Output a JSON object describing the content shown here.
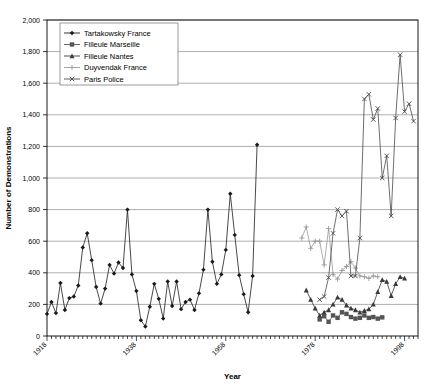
{
  "chart_data": {
    "type": "line",
    "title": "",
    "xlabel": "Year",
    "ylabel": "Number of Demonstrations",
    "xlim": [
      1918,
      2001
    ],
    "ylim": [
      0,
      2000
    ],
    "ytick_step": 200,
    "ytick_labels": [
      "0",
      "200",
      "400",
      "600",
      "800",
      "1,000",
      "1,200",
      "1,400",
      "1,600",
      "1,800",
      "2,000"
    ],
    "xtick_labels": [
      "1918",
      "1938",
      "1958",
      "1978",
      "1998"
    ],
    "xtick_values": [
      1918,
      1938,
      1958,
      1978,
      1998
    ],
    "xtick_minor_step": 1,
    "grid": "horizontal",
    "legend_position": "top-left",
    "series": [
      {
        "name": "Tartakowsky France",
        "marker": "diamond",
        "color": "#1a1a1a",
        "points": [
          [
            1918,
            140
          ],
          [
            1919,
            215
          ],
          [
            1920,
            145
          ],
          [
            1921,
            335
          ],
          [
            1922,
            165
          ],
          [
            1923,
            240
          ],
          [
            1924,
            250
          ],
          [
            1925,
            320
          ],
          [
            1926,
            560
          ],
          [
            1927,
            650
          ],
          [
            1928,
            480
          ],
          [
            1929,
            310
          ],
          [
            1930,
            205
          ],
          [
            1931,
            300
          ],
          [
            1932,
            450
          ],
          [
            1933,
            395
          ],
          [
            1934,
            465
          ],
          [
            1935,
            430
          ],
          [
            1936,
            800
          ],
          [
            1937,
            390
          ],
          [
            1938,
            285
          ],
          [
            1939,
            100
          ],
          [
            1940,
            60
          ],
          [
            1941,
            185
          ],
          [
            1942,
            330
          ],
          [
            1943,
            235
          ],
          [
            1944,
            110
          ],
          [
            1945,
            345
          ],
          [
            1946,
            190
          ],
          [
            1947,
            345
          ],
          [
            1948,
            170
          ],
          [
            1949,
            215
          ],
          [
            1950,
            230
          ],
          [
            1951,
            165
          ],
          [
            1952,
            270
          ],
          [
            1953,
            420
          ],
          [
            1954,
            800
          ],
          [
            1955,
            470
          ],
          [
            1956,
            330
          ],
          [
            1957,
            390
          ],
          [
            1958,
            545
          ],
          [
            1959,
            900
          ],
          [
            1960,
            640
          ],
          [
            1961,
            385
          ],
          [
            1962,
            265
          ],
          [
            1963,
            150
          ],
          [
            1964,
            380
          ],
          [
            1965,
            1210
          ]
        ]
      },
      {
        "name": "Filleule Marseille",
        "marker": "square",
        "color": "#555555",
        "points": [
          [
            1979,
            105
          ],
          [
            1980,
            125
          ],
          [
            1981,
            90
          ],
          [
            1982,
            130
          ],
          [
            1983,
            115
          ],
          [
            1984,
            150
          ],
          [
            1985,
            140
          ],
          [
            1986,
            120
          ],
          [
            1987,
            110
          ],
          [
            1988,
            115
          ],
          [
            1989,
            130
          ],
          [
            1990,
            115
          ],
          [
            1991,
            120
          ],
          [
            1992,
            110
          ],
          [
            1993,
            118
          ]
        ]
      },
      {
        "name": "Filleule Nantes",
        "marker": "triangle",
        "color": "#3a3a3a",
        "points": [
          [
            1976,
            290
          ],
          [
            1977,
            230
          ],
          [
            1978,
            175
          ],
          [
            1979,
            130
          ],
          [
            1980,
            150
          ],
          [
            1981,
            165
          ],
          [
            1982,
            200
          ],
          [
            1983,
            245
          ],
          [
            1984,
            230
          ],
          [
            1985,
            195
          ],
          [
            1986,
            175
          ],
          [
            1987,
            165
          ],
          [
            1988,
            150
          ],
          [
            1989,
            160
          ],
          [
            1990,
            170
          ],
          [
            1991,
            200
          ],
          [
            1992,
            280
          ],
          [
            1993,
            355
          ],
          [
            1994,
            345
          ],
          [
            1995,
            255
          ],
          [
            1996,
            330
          ],
          [
            1997,
            375
          ],
          [
            1998,
            365
          ]
        ]
      },
      {
        "name": "Duyvendak France",
        "marker": "plus",
        "color": "#999999",
        "points": [
          [
            1975,
            620
          ],
          [
            1976,
            690
          ],
          [
            1977,
            555
          ],
          [
            1978,
            600
          ],
          [
            1979,
            600
          ],
          [
            1980,
            450
          ],
          [
            1981,
            680
          ],
          [
            1982,
            390
          ],
          [
            1983,
            360
          ],
          [
            1984,
            415
          ],
          [
            1985,
            440
          ],
          [
            1986,
            470
          ],
          [
            1987,
            430
          ],
          [
            1988,
            380
          ],
          [
            1989,
            375
          ],
          [
            1990,
            365
          ],
          [
            1991,
            380
          ],
          [
            1992,
            375
          ]
        ]
      },
      {
        "name": "Paris Police",
        "marker": "x",
        "color": "#4a4a4a",
        "points": [
          [
            1979,
            230
          ],
          [
            1980,
            250
          ],
          [
            1981,
            370
          ],
          [
            1982,
            650
          ],
          [
            1983,
            800
          ],
          [
            1984,
            760
          ],
          [
            1985,
            790
          ],
          [
            1986,
            380
          ],
          [
            1987,
            380
          ],
          [
            1988,
            620
          ],
          [
            1989,
            1500
          ],
          [
            1990,
            1530
          ],
          [
            1991,
            1370
          ],
          [
            1992,
            1440
          ],
          [
            1993,
            1000
          ],
          [
            1994,
            1140
          ],
          [
            1995,
            760
          ],
          [
            1996,
            1380
          ],
          [
            1997,
            1780
          ],
          [
            1998,
            1420
          ],
          [
            1999,
            1470
          ],
          [
            2000,
            1360
          ]
        ]
      }
    ]
  },
  "legend": {
    "items": [
      {
        "label": "Tartakowsky France"
      },
      {
        "label": "Filleule Marseille"
      },
      {
        "label": "Filleule Nantes"
      },
      {
        "label": "Duyvendak France"
      },
      {
        "label": "Paris Police"
      }
    ]
  }
}
